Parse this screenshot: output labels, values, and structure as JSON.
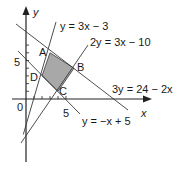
{
  "diagram": {
    "axes": {
      "x_label": "x",
      "y_label": "y",
      "origin_label": "0",
      "x_tick_label": "5",
      "y_tick_label": "5"
    },
    "lines": [
      {
        "id": "l1",
        "equation_label": "y = 3x − 3"
      },
      {
        "id": "l2",
        "equation_label": "2y = 3x − 10"
      },
      {
        "id": "l3",
        "equation_label": "3y = 24 − 2x"
      },
      {
        "id": "l4",
        "equation_label": "y = −x + 5"
      }
    ],
    "points": [
      {
        "label": "A",
        "x": 3,
        "y": 6
      },
      {
        "label": "B",
        "x": 6,
        "y": 4
      },
      {
        "label": "C",
        "x": 4,
        "y": 1
      },
      {
        "label": "D",
        "x": 2,
        "y": 3
      }
    ],
    "region": {
      "vertices": [
        "A",
        "B",
        "C",
        "D"
      ],
      "fill": "#a8a8a8"
    },
    "colors": {
      "line": "#3a3a3a",
      "text": "#1a1a1a",
      "shade": "#a8a8a8"
    }
  }
}
